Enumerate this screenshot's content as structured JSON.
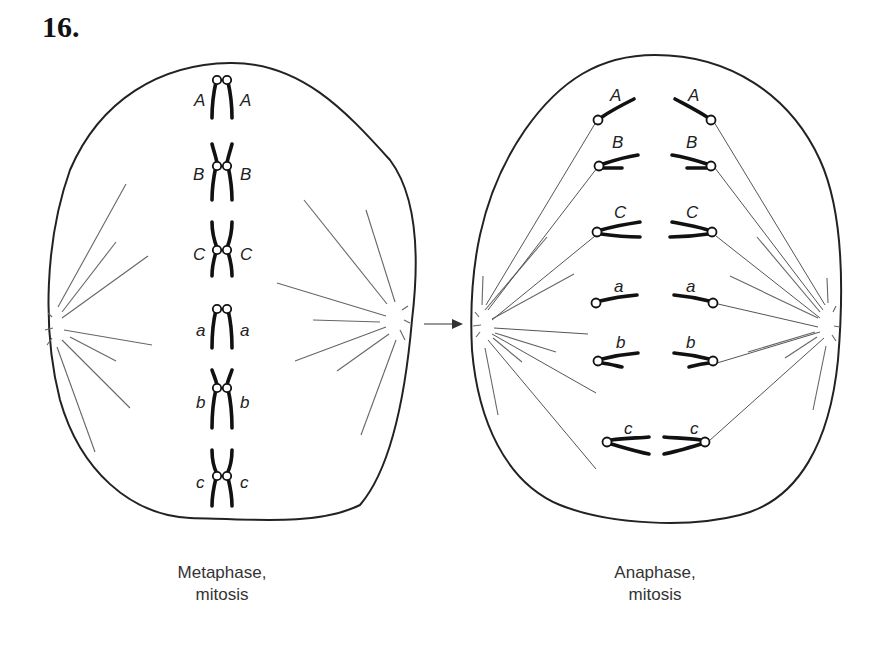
{
  "problem_number": "16.",
  "arrow": {
    "from": "metaphase",
    "to": "anaphase",
    "icon": "right-arrow"
  },
  "metaphase": {
    "caption_line1": "Metaphase,",
    "caption_line2": "mitosis",
    "chromosomes": [
      {
        "left_label": "A",
        "right_label": "A",
        "type": "acrocentric"
      },
      {
        "left_label": "B",
        "right_label": "B",
        "type": "submetacentric"
      },
      {
        "left_label": "C",
        "right_label": "C",
        "type": "metacentric"
      },
      {
        "left_label": "a",
        "right_label": "a",
        "type": "acrocentric"
      },
      {
        "left_label": "b",
        "right_label": "b",
        "type": "submetacentric"
      },
      {
        "left_label": "c",
        "right_label": "c",
        "type": "metacentric"
      }
    ]
  },
  "anaphase": {
    "caption_line1": "Anaphase,",
    "caption_line2": "mitosis",
    "chromosomes": [
      {
        "left_label": "A",
        "right_label": "A"
      },
      {
        "left_label": "B",
        "right_label": "B"
      },
      {
        "left_label": "C",
        "right_label": "C"
      },
      {
        "left_label": "a",
        "right_label": "a"
      },
      {
        "left_label": "b",
        "right_label": "b"
      },
      {
        "left_label": "c",
        "right_label": "c"
      }
    ]
  }
}
